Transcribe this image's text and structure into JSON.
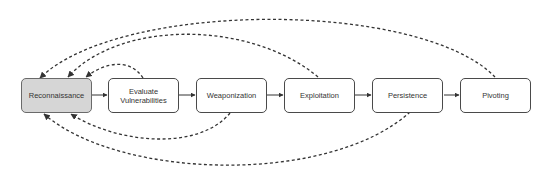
{
  "diagram": {
    "type": "flowchart",
    "nodes": [
      {
        "id": "recon",
        "label": "Reconnaissance",
        "highlighted": true,
        "fill": "#d6d6d6"
      },
      {
        "id": "eval",
        "label": "Evaluate\nVulnerabilities",
        "highlighted": false,
        "fill": "#ffffff"
      },
      {
        "id": "weap",
        "label": "Weaponization",
        "highlighted": false,
        "fill": "#ffffff"
      },
      {
        "id": "expl",
        "label": "Exploitation",
        "highlighted": false,
        "fill": "#ffffff"
      },
      {
        "id": "pers",
        "label": "Persistence",
        "highlighted": false,
        "fill": "#ffffff"
      },
      {
        "id": "pivot",
        "label": "Pivoting",
        "highlighted": false,
        "fill": "#ffffff"
      }
    ],
    "edges_solid": [
      {
        "from": "recon",
        "to": "eval"
      },
      {
        "from": "eval",
        "to": "weap"
      },
      {
        "from": "weap",
        "to": "expl"
      },
      {
        "from": "expl",
        "to": "pers"
      },
      {
        "from": "pers",
        "to": "pivot"
      }
    ],
    "edges_dashed_feedback": [
      {
        "from": "eval",
        "to": "recon",
        "side": "top"
      },
      {
        "from": "expl",
        "to": "recon",
        "side": "top"
      },
      {
        "from": "pivot",
        "to": "recon",
        "side": "top"
      },
      {
        "from": "weap",
        "to": "recon",
        "side": "bottom"
      },
      {
        "from": "pers",
        "to": "recon",
        "side": "bottom"
      }
    ],
    "colors": {
      "stroke": "#333333",
      "start_fill": "#d6d6d6",
      "node_fill": "#ffffff"
    }
  }
}
